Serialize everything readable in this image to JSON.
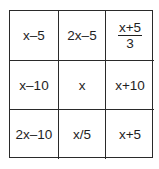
{
  "grid": {
    "rows": [
      [
        "x–5",
        "2x–5",
        {
          "numerator": "x+5",
          "denominator": "3"
        }
      ],
      [
        "x–10",
        "x",
        "x+10"
      ],
      [
        "2x–10",
        "x/5",
        "x+5"
      ]
    ],
    "cells": {
      "r0c0": "x–5",
      "r0c1": "2x–5",
      "r0c2_num": "x+5",
      "r0c2_den": "3",
      "r1c0": "x–10",
      "r1c1": "x",
      "r1c2": "x+10",
      "r2c0": "2x–10",
      "r2c1": "x/5",
      "r2c2": "x+5"
    },
    "line_color": "#2a2a2a",
    "text_color": "#1e1e1e"
  }
}
